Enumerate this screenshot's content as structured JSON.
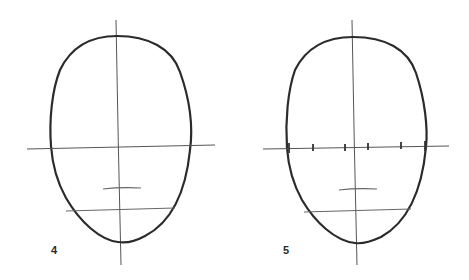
{
  "figure": {
    "type": "face proportion construction drawing",
    "colors": {
      "outline": "#2b2b2b",
      "guide": "#555555",
      "background": "#ffffff"
    },
    "panels": [
      {
        "step": "4",
        "head_outline": "egg-shaped oval",
        "guides": [
          "vertical center line",
          "horizontal eye line",
          "nose mark",
          "mouth line"
        ],
        "eye_line_ticks": 0
      },
      {
        "step": "5",
        "head_outline": "egg-shaped oval",
        "guides": [
          "vertical center line",
          "horizontal eye line with five-eye division ticks",
          "nose mark",
          "mouth line"
        ],
        "eye_line_ticks": 6
      }
    ]
  }
}
